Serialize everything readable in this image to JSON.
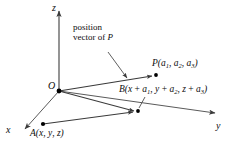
{
  "figure": {
    "background_color": "#ffffff",
    "line_color": "#4d4d4d",
    "text_color": "#0d0d0d"
  },
  "axes": [
    {
      "name": "z-axis",
      "label": "z",
      "direction": "up"
    },
    {
      "name": "y-axis",
      "label": "y",
      "direction": "right"
    },
    {
      "name": "x-axis",
      "label": "x",
      "direction": "down-left"
    }
  ],
  "points": [
    {
      "name": "origin",
      "label": "O",
      "x": 59,
      "y": 91
    },
    {
      "name": "point-P",
      "label_prefix": "P",
      "coords": [
        "a",
        "a",
        "a"
      ],
      "subs": [
        "1",
        "2",
        "3"
      ],
      "x": 155,
      "y": 76
    },
    {
      "name": "point-B",
      "label_prefix": "B",
      "x": 137,
      "y": 111
    },
    {
      "name": "point-A",
      "label_prefix": "A",
      "x": 43,
      "y": 124
    }
  ],
  "labels": {
    "z": "z",
    "y": "y",
    "x": "x",
    "origin": "O",
    "P_prefix": "P(",
    "P_a1": "a",
    "P_sub1": "1",
    "P_sep1": ", ",
    "P_a2": "a",
    "P_sub2": "2",
    "P_sep2": ", ",
    "P_a3": "a",
    "P_sub3": "3",
    "P_suffix": ")",
    "B_prefix": "B(",
    "B_x": "x",
    "B_plus1": " + ",
    "B_a1": "a",
    "B_sub1": "1",
    "B_sep1": ", ",
    "B_y": "y",
    "B_plus2": " + ",
    "B_a2": "a",
    "B_sub2": "2",
    "B_sep2": ", ",
    "B_z": "z",
    "B_plus3": " + ",
    "B_a3": "a",
    "B_sub3": "3",
    "B_suffix": ")",
    "A_prefix": "A(",
    "A_x": "x",
    "A_sep1": ", ",
    "A_y": "y",
    "A_sep2": ", ",
    "A_z": "z",
    "A_suffix": ")",
    "note_line1": "position",
    "note_line2_pre": "vector of ",
    "note_line2_var": "P"
  }
}
